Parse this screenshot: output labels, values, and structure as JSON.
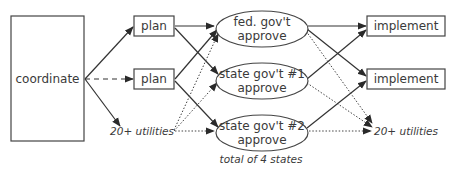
{
  "diagram": {
    "nodes": {
      "coordinate": {
        "label": "coordinate"
      },
      "plan_1": {
        "label": "plan"
      },
      "plan_2": {
        "label": "plan"
      },
      "utilities_left": {
        "label": "20+ utilities"
      },
      "fed_approve": {
        "line1": "fed. gov't",
        "line2": "approve"
      },
      "state1_approve": {
        "line1": "state gov't #1",
        "line2": "approve"
      },
      "state2_approve": {
        "line1": "state gov't #2",
        "line2": "approve"
      },
      "implement_1": {
        "label": "implement"
      },
      "implement_2": {
        "label": "implement"
      },
      "utilities_right": {
        "label": "20+ utilities"
      }
    },
    "footnote": "total of 4 states",
    "edges": [
      {
        "from": "coordinate",
        "to": "plan_1",
        "style": "solid"
      },
      {
        "from": "coordinate",
        "to": "plan_2",
        "style": "dashed"
      },
      {
        "from": "coordinate",
        "to": "utilities_left",
        "style": "solid"
      },
      {
        "from": "plan_1",
        "to": "fed_approve",
        "style": "solid"
      },
      {
        "from": "plan_1",
        "to": "state1_approve",
        "style": "solid"
      },
      {
        "from": "plan_2",
        "to": "fed_approve",
        "style": "solid"
      },
      {
        "from": "plan_2",
        "to": "state2_approve",
        "style": "solid"
      },
      {
        "from": "utilities_left",
        "to": "fed_approve",
        "style": "dotted"
      },
      {
        "from": "utilities_left",
        "to": "state1_approve",
        "style": "dotted"
      },
      {
        "from": "utilities_left",
        "to": "state2_approve",
        "style": "dotted"
      },
      {
        "from": "fed_approve",
        "to": "implement_1",
        "style": "solid"
      },
      {
        "from": "fed_approve",
        "to": "implement_2",
        "style": "solid"
      },
      {
        "from": "fed_approve",
        "to": "utilities_right",
        "style": "dotted"
      },
      {
        "from": "state1_approve",
        "to": "implement_1",
        "style": "solid"
      },
      {
        "from": "state1_approve",
        "to": "utilities_right",
        "style": "dotted"
      },
      {
        "from": "state2_approve",
        "to": "implement_2",
        "style": "solid"
      },
      {
        "from": "state2_approve",
        "to": "utilities_right",
        "style": "dotted"
      }
    ],
    "colors": {
      "stroke": "#333333",
      "text": "#3a3a3a",
      "background": "#ffffff"
    }
  }
}
